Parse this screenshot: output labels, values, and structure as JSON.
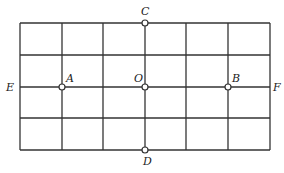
{
  "diagram": {
    "type": "grid-with-points",
    "grid": {
      "columns": 6,
      "rows": 4,
      "x_lines": [
        20,
        62,
        103,
        145,
        186,
        228,
        270
      ],
      "y_lines": [
        23,
        55,
        87,
        118,
        150
      ],
      "line_color": "#333333"
    },
    "points": [
      {
        "id": "A",
        "label": "A",
        "x": 62,
        "y": 87,
        "label_dx": 4,
        "label_dy": -5
      },
      {
        "id": "O",
        "label": "O",
        "x": 145,
        "y": 87,
        "label_dx": -11,
        "label_dy": -5
      },
      {
        "id": "B",
        "label": "B",
        "x": 228,
        "y": 87,
        "label_dx": 4,
        "label_dy": -5
      },
      {
        "id": "C",
        "label": "C",
        "x": 145,
        "y": 23,
        "label_dx": -4,
        "label_dy": -8
      },
      {
        "id": "D",
        "label": "D",
        "x": 145,
        "y": 150,
        "label_dx": -2,
        "label_dy": 15
      }
    ],
    "line_labels": [
      {
        "id": "E",
        "label": "E",
        "x": 6,
        "y": 91
      },
      {
        "id": "F",
        "label": "F",
        "x": 273,
        "y": 91
      }
    ]
  }
}
